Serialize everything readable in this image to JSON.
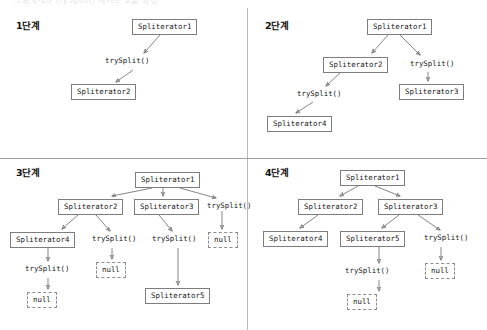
{
  "page": {
    "top_clipped_caption": "그림 8-20 trySplit() 메서드 호출 과정",
    "colors": {
      "background": "#ffffff",
      "box_border": "#7d7d7d",
      "dashed_border": "#8c8c8c",
      "edge": "#6f6f6f",
      "divider_vertical": "#b9b9b9",
      "divider_horizontal": "#9d9d9d",
      "text": "#161616"
    }
  },
  "labels": {
    "try_split": "trySplit()",
    "null_value": "null",
    "spliterator1": "Spliterator1",
    "spliterator2": "Spliterator2",
    "spliterator3": "Spliterator3",
    "spliterator4": "Spliterator4",
    "spliterator5": "Spliterator5"
  },
  "quadrants": [
    {
      "id": "step-1",
      "title": "1단계",
      "nodes": [
        {
          "key": "s1",
          "text": "Spliterator1",
          "style": "boxed"
        },
        {
          "key": "ts1",
          "text": "trySplit()",
          "style": "plain"
        },
        {
          "key": "s2",
          "text": "Spliterator2",
          "style": "boxed"
        }
      ]
    },
    {
      "id": "step-2",
      "title": "2단계",
      "nodes": [
        {
          "key": "s1",
          "text": "Spliterator1",
          "style": "boxed"
        },
        {
          "key": "s2",
          "text": "Spliterator2",
          "style": "boxed"
        },
        {
          "key": "ts1",
          "text": "trySplit()",
          "style": "plain"
        },
        {
          "key": "ts2",
          "text": "trySplit()",
          "style": "plain"
        },
        {
          "key": "s3",
          "text": "Spliterator3",
          "style": "boxed"
        },
        {
          "key": "s4",
          "text": "Spliterator4",
          "style": "boxed"
        }
      ]
    },
    {
      "id": "step-3",
      "title": "3단계",
      "nodes": [
        {
          "key": "s1",
          "text": "Spliterator1",
          "style": "boxed"
        },
        {
          "key": "s2",
          "text": "Spliterator2",
          "style": "boxed"
        },
        {
          "key": "s3",
          "text": "Spliterator3",
          "style": "boxed"
        },
        {
          "key": "ts1",
          "text": "trySplit()",
          "style": "plain"
        },
        {
          "key": "s4",
          "text": "Spliterator4",
          "style": "boxed"
        },
        {
          "key": "ts2",
          "text": "trySplit()",
          "style": "plain"
        },
        {
          "key": "ts3",
          "text": "trySplit()",
          "style": "plain"
        },
        {
          "key": "n1",
          "text": "null",
          "style": "dashed"
        },
        {
          "key": "ts4",
          "text": "trySplit()",
          "style": "plain"
        },
        {
          "key": "n2",
          "text": "null",
          "style": "dashed"
        },
        {
          "key": "s5",
          "text": "Spliterator5",
          "style": "boxed"
        },
        {
          "key": "n3",
          "text": "null",
          "style": "dashed"
        }
      ]
    },
    {
      "id": "step-4",
      "title": "4단계",
      "nodes": [
        {
          "key": "s1",
          "text": "Spliterator1",
          "style": "boxed"
        },
        {
          "key": "s2",
          "text": "Spliterator2",
          "style": "boxed"
        },
        {
          "key": "s3",
          "text": "Spliterator3",
          "style": "boxed"
        },
        {
          "key": "s4",
          "text": "Spliterator4",
          "style": "boxed"
        },
        {
          "key": "s5",
          "text": "Spliterator5",
          "style": "boxed"
        },
        {
          "key": "ts1",
          "text": "trySplit()",
          "style": "plain"
        },
        {
          "key": "ts2",
          "text": "trySplit()",
          "style": "plain"
        },
        {
          "key": "n1",
          "text": "null",
          "style": "dashed"
        },
        {
          "key": "n2",
          "text": "null",
          "style": "dashed"
        }
      ]
    }
  ]
}
